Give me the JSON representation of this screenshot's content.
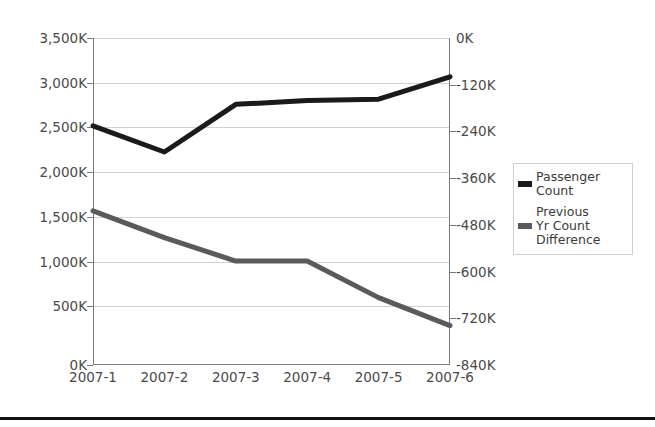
{
  "chart_data": {
    "type": "line",
    "title": "",
    "xlabel": "",
    "categories": [
      "2007-1",
      "2007-2",
      "2007-3",
      "2007-4",
      "2007-5",
      "2007-6"
    ],
    "series": [
      {
        "name": "Passenger Count",
        "axis": "left",
        "color": "#1a1a1a",
        "values": [
          2560000,
          2280000,
          2790000,
          2830000,
          2845000,
          3085000
        ]
      },
      {
        "name": "Previous Yr Count Difference",
        "axis": "right",
        "color": "#5a5a5a",
        "values": [
          -444000,
          -513000,
          -573000,
          -573000,
          -667000,
          -739000
        ]
      }
    ],
    "left_axis": {
      "label": "",
      "ticks": [
        "0K",
        "500K",
        "1,000K",
        "1,500K",
        "2,000K",
        "2,500K",
        "3,000K",
        "3,500K"
      ],
      "tick_values": [
        0,
        500000,
        1000000,
        1500000,
        2000000,
        2500000,
        3000000,
        3500000
      ],
      "ylim": [
        0,
        3500000
      ]
    },
    "right_axis": {
      "label": "",
      "ticks": [
        "-840K",
        "-720K",
        "-600K",
        "-480K",
        "-360K",
        "-240K",
        "-120K",
        "0K"
      ],
      "tick_values": [
        -840000,
        -720000,
        -600000,
        -480000,
        -360000,
        -240000,
        -120000,
        0
      ],
      "ylim": [
        -840000,
        0
      ]
    },
    "grid": true,
    "legend_position": "right",
    "legend": [
      {
        "label": "Passenger Count",
        "color": "#1a1a1a"
      },
      {
        "label": "Previous Yr Count Difference",
        "color": "#5a5a5a"
      }
    ]
  },
  "legend": {
    "entries": [
      {
        "line1": "Passenger",
        "line2": "Count",
        "line3": ""
      },
      {
        "line1": "Previous",
        "line2": "Yr Count",
        "line3": "Difference"
      }
    ]
  }
}
